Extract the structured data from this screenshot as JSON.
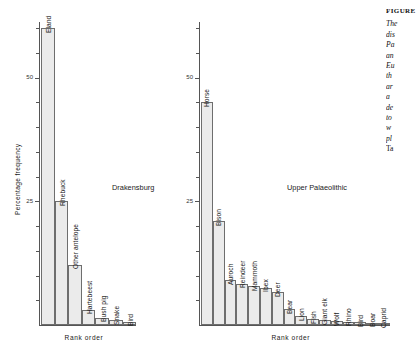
{
  "figure": {
    "y_axis_title": "Percentage frequency",
    "x_axis_title": "Rank  order",
    "tick_labels": [
      "25",
      "50"
    ]
  },
  "caption": {
    "heading": "FIGURE",
    "lines": [
      "The",
      "dis",
      "Pa",
      "an",
      "Eu",
      "th",
      "ar",
      "a",
      "de",
      "to",
      "w",
      "pl"
    ],
    "last_line": "Ta"
  },
  "chart_data": [
    {
      "type": "bar",
      "title": "Drakensburg",
      "xlabel": "Rank  order",
      "ylabel": "Percentage frequency",
      "ylim": [
        0,
        62
      ],
      "yticks": [
        25,
        50
      ],
      "grid": false,
      "legend": "none",
      "categories": [
        "Eland",
        "Rhebuck",
        "Other antelope",
        "Hartebeest",
        "Bush pig",
        "Snake",
        "Bird"
      ],
      "values": [
        60,
        25,
        12.2,
        3.1,
        1.5,
        1.0,
        0.7
      ]
    },
    {
      "type": "bar",
      "title": "Upper Palaeolithic",
      "xlabel": "Rank  order",
      "ylabel": "Percentage frequency",
      "ylim": [
        0,
        62
      ],
      "yticks": [
        25,
        50
      ],
      "grid": false,
      "legend": "none",
      "categories": [
        "Horse",
        "Bison",
        "Auroch",
        "Reindeer",
        "Mammoth",
        "Ibex",
        "Deer",
        "Bear",
        "Lion",
        "Fish",
        "Giant elk",
        "Wolf",
        "Rhino",
        "Bird",
        "Boar",
        "Caprid"
      ],
      "values": [
        45,
        21,
        9.0,
        8.3,
        7.8,
        7.5,
        6.6,
        3.2,
        1.8,
        1.2,
        1.0,
        0.8,
        0.7,
        0.6,
        0.5,
        0.3
      ]
    }
  ]
}
